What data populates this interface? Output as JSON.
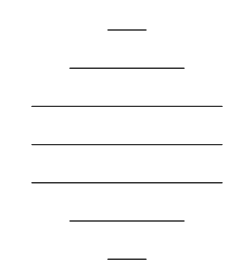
{
  "figure": {
    "name": "hexagonal-triangular-grid",
    "background_color": "#ffffff",
    "line_color": "#333333",
    "line_width": 1.4,
    "canvas": {
      "width": 249,
      "height": 279
    }
  },
  "chart_data": {
    "type": "diagram",
    "shape": "hexagon",
    "lattice": "triangular",
    "xlabel": "",
    "ylabel": "",
    "xlim": [
      0,
      249
    ],
    "ylim": [
      0,
      279
    ],
    "grid": true,
    "legend": "none",
    "geometry": {
      "origin_x": 22,
      "origin_y": 30,
      "cell_width": 38,
      "row_height": 38.2,
      "rows": 7,
      "row_y_values": [
        30,
        68.2,
        106.4,
        144.6,
        182.8,
        221,
        259.2
      ],
      "columns_x_values": [
        22,
        60,
        98,
        136,
        174,
        212,
        232
      ],
      "triangle_count": 54,
      "vertex_count": 37
    },
    "rows": [
      {
        "index": 0,
        "y": 30,
        "x_start": 108,
        "x_end": 146,
        "cells": 1
      },
      {
        "index": 1,
        "y": 68.2,
        "x_start": 41,
        "x_end": 213,
        "cells": 3
      },
      {
        "index": 2,
        "y": 106.4,
        "x_start": 22,
        "x_end": 232,
        "cells": 5
      },
      {
        "index": 3,
        "y": 144.6,
        "x_start": 41,
        "x_end": 213,
        "cells": 5
      },
      {
        "index": 4,
        "y": 182.8,
        "x_start": 22,
        "x_end": 232,
        "cells": 5
      },
      {
        "index": 5,
        "y": 221,
        "x_start": 41,
        "x_end": 213,
        "cells": 3
      },
      {
        "index": 6,
        "y": 259.2,
        "x_start": 108,
        "x_end": 146,
        "cells": 1
      }
    ],
    "horizontal_lines": [
      {
        "x1": 108,
        "y1": 30,
        "x2": 146,
        "y2": 30
      },
      {
        "x1": 41,
        "y1": 68.2,
        "x2": 213,
        "y2": 68.2
      },
      {
        "x1": 22,
        "y1": 106.4,
        "x2": 232,
        "y2": 106.4
      },
      {
        "x1": 41,
        "y1": 144.6,
        "x2": 213,
        "y2": 144.6
      },
      {
        "x1": 22,
        "y1": 182.8,
        "x2": 232,
        "y2": 182.8
      },
      {
        "x1": 41,
        "y1": 221,
        "x2": 213,
        "y2": 221
      },
      {
        "x1": 108,
        "y1": 259.2,
        "x2": 146,
        "y2": 259.2
      }
    ],
    "down_right_lines": [
      {
        "x1": 108,
        "y1": 30,
        "x2": 41,
        "y2": 68.2
      },
      {
        "x1": 146,
        "y1": 30,
        "x2": 41,
        "y2": 106.4
      },
      {
        "x1": 213,
        "y1": 68.2,
        "x2": 41,
        "y2": 182.8
      },
      {
        "x1": 232,
        "y1": 106.4,
        "x2": 60,
        "y2": 221
      },
      {
        "x1": 232,
        "y1": 182.8,
        "x2": 146,
        "y2": 259.2
      },
      {
        "x1": 213,
        "y1": 221,
        "x2": 184,
        "y2": 240
      }
    ],
    "down_left_lines": [
      {
        "x1": 146,
        "y1": 30,
        "x2": 213,
        "y2": 68.2
      },
      {
        "x1": 108,
        "y1": 30,
        "x2": 213,
        "y2": 106.4
      },
      {
        "x1": 41,
        "y1": 68.2,
        "x2": 213,
        "y2": 182.8
      },
      {
        "x1": 22,
        "y1": 106.4,
        "x2": 194,
        "y2": 221
      },
      {
        "x1": 22,
        "y1": 182.8,
        "x2": 108,
        "y2": 259.2
      },
      {
        "x1": 41,
        "y1": 221,
        "x2": 70,
        "y2": 240
      }
    ]
  }
}
